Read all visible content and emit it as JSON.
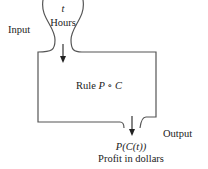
{
  "diagram": {
    "input": {
      "label": "Input",
      "variable": "t",
      "variable_desc": "Hours"
    },
    "process": {
      "rule_prefix": "Rule",
      "rule_expr": "P ∘ C"
    },
    "output": {
      "label": "Output",
      "expression": "P(C(t))",
      "expression_desc": "Profit in dollars"
    },
    "colors": {
      "stroke": "#555555",
      "text": "#222222"
    }
  }
}
